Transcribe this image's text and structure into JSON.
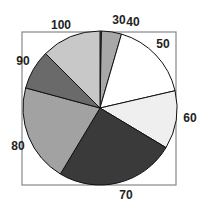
{
  "chart_data": {
    "type": "pie",
    "title": "",
    "start_angle_deg": 0,
    "direction": "clockwise",
    "frame": true,
    "slices": [
      {
        "label": "30",
        "value": 0.3,
        "color": "#9a9a9a"
      },
      {
        "label": "40",
        "value": 4.2,
        "color": "#a8a8a8"
      },
      {
        "label": "50",
        "value": 16.9,
        "color": "#ffffff"
      },
      {
        "label": "60",
        "value": 12.2,
        "color": "#efefef"
      },
      {
        "label": "70",
        "value": 25.0,
        "color": "#3a3a3a"
      },
      {
        "label": "80",
        "value": 20.6,
        "color": "#a2a2a2"
      },
      {
        "label": "90",
        "value": 8.3,
        "color": "#6a6a6a"
      },
      {
        "label": "100",
        "value": 12.5,
        "color": "#c8c8c8"
      }
    ]
  }
}
